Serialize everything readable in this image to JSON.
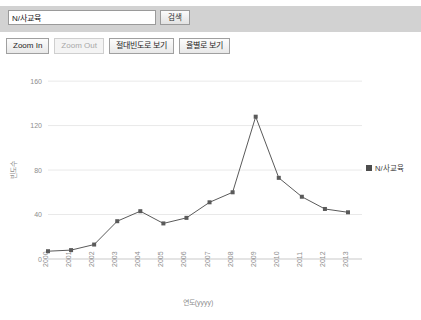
{
  "search": {
    "value": "N/사교육",
    "placeholder": "",
    "button_label": "검색"
  },
  "toolbar": {
    "buttons": [
      {
        "label": "Zoom In",
        "disabled": false
      },
      {
        "label": "Zoom Out",
        "disabled": true
      },
      {
        "label": "절대빈도로 보기",
        "disabled": false
      },
      {
        "label": "율별로 보기",
        "disabled": false
      }
    ]
  },
  "legend": {
    "label": "N/사교육",
    "color": "#4d4d4d"
  },
  "chart_data": {
    "type": "line",
    "title": "",
    "xlabel": "연도(yyyy)",
    "ylabel": "빈도수",
    "categories": [
      "2000",
      "2001",
      "2002",
      "2003",
      "2004",
      "2005",
      "2006",
      "2007",
      "2008",
      "2009",
      "2010",
      "2011",
      "2012",
      "2013"
    ],
    "series": [
      {
        "name": "N/사교육",
        "color": "#5a5a5a",
        "values": [
          7,
          8,
          13,
          34,
          43,
          32,
          37,
          51,
          60,
          128,
          73,
          56,
          45,
          42
        ]
      }
    ],
    "yticks": [
      0,
      40,
      80,
      120,
      160
    ],
    "ylim": [
      0,
      170
    ],
    "grid": true,
    "legend_position": "right",
    "marker": "square"
  }
}
